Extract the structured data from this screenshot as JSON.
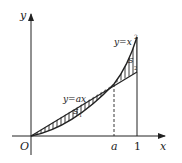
{
  "diagram": {
    "axes": {
      "x_label": "x",
      "y_label": "y",
      "origin_label": "O"
    },
    "ticks": {
      "a_label": "a",
      "one_label": "1"
    },
    "curves": {
      "parabola_label": "y=x",
      "parabola_exponent": "2",
      "line_label": "y=ax"
    },
    "regions": {
      "s1_label": "S",
      "s1_sub": "1",
      "s2_label": "S",
      "s2_sub": "2"
    },
    "colors": {
      "stroke": "#222222",
      "background": "#ffffff"
    }
  }
}
